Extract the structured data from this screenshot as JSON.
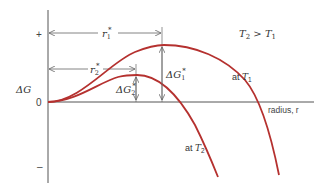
{
  "diagram": {
    "condition": "T₂ > T₁",
    "y_axis": {
      "label": "ΔG",
      "ticks": {
        "plus": "+",
        "zero": "0",
        "minus": "–"
      }
    },
    "x_axis": {
      "label": "radius, r"
    },
    "curves": [
      {
        "name": "T1",
        "label": "at T₁",
        "critical_radius": "r₁*",
        "barrier": "ΔG₁*"
      },
      {
        "name": "T2",
        "label": "at T₂",
        "critical_radius": "r₂*",
        "barrier": "ΔG₂*"
      }
    ],
    "labels": {
      "r1": "r",
      "r1_sub": "1",
      "r1_sup": "*",
      "r2": "r",
      "r2_sub": "2",
      "r2_sup": "*",
      "dg1": "ΔG",
      "dg1_sub": "1",
      "dg1_sup": "*",
      "dg2": "ΔG",
      "dg2_sub": "2",
      "dg2_sup": "*",
      "at_t1": "at ",
      "t1": "T",
      "t1_sub": "1",
      "at_t2": "at ",
      "t2": "T",
      "t2_sub": "2",
      "cond_t2": "T",
      "cond_t2_sub": "2",
      "cond_gt": " > ",
      "cond_t1": "T",
      "cond_t1_sub": "1"
    },
    "colors": {
      "curve": "#b5312f",
      "axis": "#555555",
      "text": "#333333"
    }
  }
}
